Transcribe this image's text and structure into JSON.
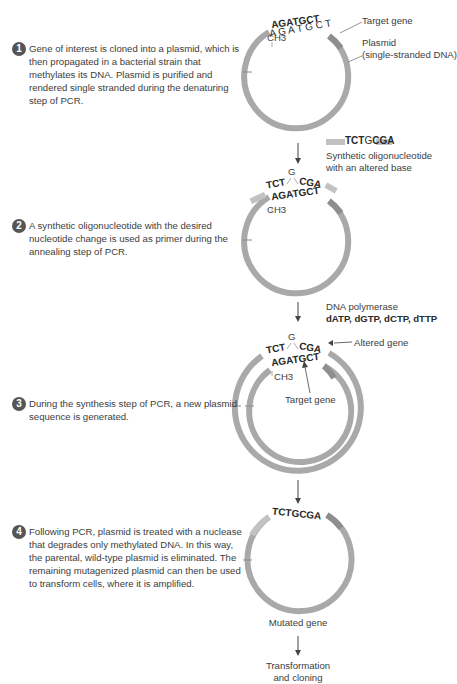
{
  "steps": [
    {
      "number": "1",
      "text": "Gene of interest is cloned into a plasmid, which is then propagated in a bacterial strain that methylates its DNA. Plasmid is purified and rendered single stranded during the denaturing step of PCR."
    },
    {
      "number": "2",
      "text": "A synthetic oligonucleotide with the desired nucleotide change is used as primer during the annealing step of PCR."
    },
    {
      "number": "3",
      "text": "During the synthesis step of PCR, a new plasmid sequence is generated."
    },
    {
      "number": "4",
      "text": "Following PCR, plasmid is treated with a nuclease that degrades only methylated DNA. In this way, the parental, wild-type plasmid is eliminated. The remaining mutagenized plasmid can then be used to transform cells, where it is amplified."
    }
  ],
  "labels": {
    "target_gene": "Target gene",
    "plasmid": "Plasmid",
    "plasmid_sub": "(single-stranded DNA)",
    "oligo_seq_a": "TCT",
    "oligo_seq_b": "G",
    "oligo_seq_c": "CGA",
    "oligo_desc_1": "Synthetic oligonucleotide",
    "oligo_desc_2": "with an altered base",
    "polymerase": "DNA polymerase",
    "dntps": "dATP, dGTP, dCTP, dTTP",
    "altered_gene": "Altered gene",
    "target_gene_inner": "Target gene",
    "mutated_gene": "Mutated gene",
    "transformation_1": "Transformation",
    "transformation_2": "and cloning"
  },
  "sequences": {
    "template": "AGATGCT",
    "methyl": "CH3",
    "primer_left": "TCT",
    "primer_altered": "G",
    "primer_right": "CGA",
    "mutated": "TCTGCGA"
  },
  "colors": {
    "strand": "#a9a9a9",
    "strand_dark": "#8e8e8e",
    "primer": "#c2c2c2",
    "text": "#3d3d3d",
    "badge": "#555555"
  }
}
